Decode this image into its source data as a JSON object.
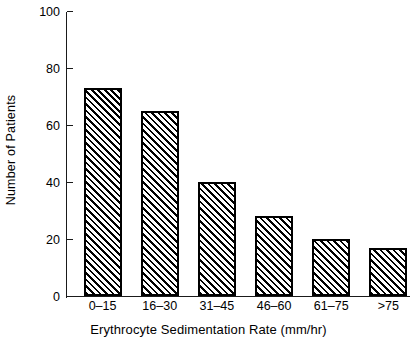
{
  "chart_data": {
    "type": "bar",
    "title": "",
    "subtitle": "",
    "xlabel": "Erythrocyte Sedimentation Rate (mm/hr)",
    "ylabel": "Number of Patients",
    "categories": [
      "0–15",
      "16–30",
      "31–45",
      "46–60",
      "61–75",
      ">75"
    ],
    "values": [
      73,
      65,
      40,
      28,
      20,
      17
    ],
    "series": [
      {
        "name": "Number of Patients",
        "values": [
          73,
          65,
          40,
          28,
          20,
          17
        ]
      }
    ],
    "ylim": [
      0,
      100
    ],
    "yticks": [
      0,
      20,
      40,
      60,
      80,
      100
    ],
    "ytick_labels": [
      "0",
      "20",
      "40",
      "60",
      "80",
      "100"
    ],
    "xlim_categorical": true,
    "grid": false,
    "legend": false,
    "legend_position": "none",
    "bar_fill": "diagonal-hatch",
    "bar_edge_color": "#000000",
    "bar_face_color": "#ffffff",
    "background_color": "#ffffff",
    "axis_color": "#1a1a1a",
    "annotations": []
  }
}
